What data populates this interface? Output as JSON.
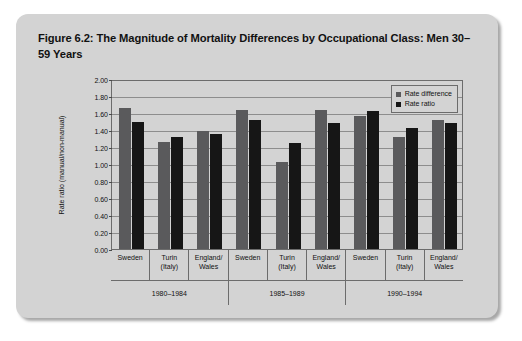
{
  "figure": {
    "title": "Figure 6.2: The Magnitude of Mortality Differences by Occupational Class: Men 30–59 Years"
  },
  "colors": {
    "panel_background": "#d3d3d3",
    "page_background": "#ffffff",
    "axis_line": "#6c6c6c",
    "gridline": "#8d8d8d",
    "rate_difference": "#5a5a5c",
    "rate_ratio": "#161616",
    "text": "#111111"
  },
  "chart_data": {
    "type": "bar",
    "title": "Figure 6.2: The Magnitude of Mortality Differences by Occupational Class: Men 30–59 Years",
    "xlabel": "",
    "ylabel": "Rate ratio (manual/non-manual)",
    "ylim": [
      0,
      2.0
    ],
    "ytick_step": 0.2,
    "ytick_labels": [
      "0.00",
      "0.20",
      "0.40",
      "0.60",
      "0.80",
      "1.00",
      "1.20",
      "1.40",
      "1.60",
      "1.80",
      "2.00"
    ],
    "ytick_values": [
      0,
      0.2,
      0.4,
      0.6,
      0.8,
      1.0,
      1.2,
      1.4,
      1.6,
      1.8,
      2.0
    ],
    "grid": true,
    "legend_position": "top-right",
    "categories": [
      "Sweden",
      "Turin (Italy)",
      "England/ Wales",
      "Sweden",
      "Turin (Italy)",
      "England/ Wales",
      "Sweden",
      "Turin (Italy)",
      "England/ Wales"
    ],
    "category_lines": [
      [
        "Sweden"
      ],
      [
        "Turin",
        "(Italy)"
      ],
      [
        "England/",
        "Wales"
      ],
      [
        "Sweden"
      ],
      [
        "Turin",
        "(Italy)"
      ],
      [
        "England/",
        "Wales"
      ],
      [
        "Sweden"
      ],
      [
        "Turin",
        "(Italy)"
      ],
      [
        "England/",
        "Wales"
      ]
    ],
    "group_labels": [
      "1980–1984",
      "1985–1989",
      "1990–1994"
    ],
    "group_size": 3,
    "series": [
      {
        "name": "Rate difference",
        "color": "#5a5a5c",
        "values": [
          1.66,
          1.26,
          1.39,
          1.63,
          1.02,
          1.64,
          1.56,
          1.32,
          1.52
        ]
      },
      {
        "name": "Rate ratio",
        "color": "#161616",
        "values": [
          1.5,
          1.32,
          1.35,
          1.52,
          1.25,
          1.48,
          1.62,
          1.42,
          1.48
        ]
      }
    ]
  }
}
